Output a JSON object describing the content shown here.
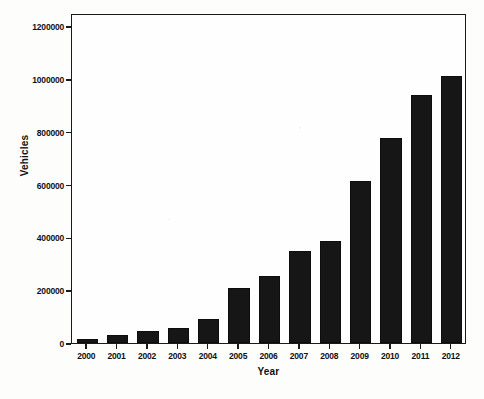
{
  "chart_data": {
    "type": "bar",
    "title": "",
    "subtitle": "",
    "xlabel": "Year",
    "ylabel": "Vehicles",
    "categories": [
      "2000",
      "2001",
      "2002",
      "2003",
      "2004",
      "2005",
      "2006",
      "2007",
      "2008",
      "2009",
      "2010",
      "2011",
      "2012"
    ],
    "values": [
      15000,
      30000,
      47000,
      55000,
      92000,
      210000,
      255000,
      350000,
      385000,
      615000,
      775000,
      940000,
      1010000
    ],
    "series": [
      {
        "name": "Vehicles",
        "values": [
          15000,
          30000,
          47000,
          55000,
          92000,
          210000,
          255000,
          350000,
          385000,
          615000,
          775000,
          940000,
          1010000
        ],
        "color": "#161616"
      }
    ],
    "ylim": [
      0,
      1250000
    ],
    "xlim": [
      -0.5,
      12.5
    ],
    "y_ticks": [
      0,
      200000,
      400000,
      600000,
      800000,
      1000000,
      1200000
    ],
    "y_tick_labels": [
      "0",
      "200000",
      "400000",
      "600000",
      "800000",
      "1000000",
      "1200000"
    ],
    "x_ticks": [
      "2000",
      "2001",
      "2002",
      "2003",
      "2004",
      "2005",
      "2006",
      "2007",
      "2008",
      "2009",
      "2010",
      "2011",
      "2012"
    ],
    "grid": false,
    "legend": false,
    "legend_position": "none",
    "bar_color": "#161616",
    "frame_color": "#1a1a1a",
    "background_color": "#ffffff",
    "annotations": []
  }
}
